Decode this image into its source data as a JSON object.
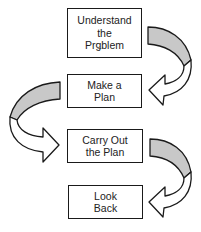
{
  "diagram": {
    "type": "flowchart",
    "steps": [
      {
        "id": 1,
        "lines": [
          "Understand",
          "the",
          "Prǥblem"
        ]
      },
      {
        "id": 2,
        "lines": [
          "Make a",
          "Plan"
        ]
      },
      {
        "id": 3,
        "lines": [
          "Carry Out",
          "the Plan"
        ]
      },
      {
        "id": 4,
        "lines": [
          "Look",
          "Back"
        ]
      }
    ],
    "connectors": [
      {
        "from": 1,
        "to": 2,
        "side": "right",
        "style": "curved-ribbon-arrow"
      },
      {
        "from": 2,
        "to": 3,
        "side": "left",
        "style": "curved-ribbon-arrow"
      },
      {
        "from": 3,
        "to": 4,
        "side": "right",
        "style": "curved-ribbon-arrow"
      }
    ],
    "colors": {
      "stroke": "#1a1a1a",
      "ribbon_shade": "#c8c8c8",
      "box_fill": "#ffffff",
      "text": "#222222"
    }
  }
}
